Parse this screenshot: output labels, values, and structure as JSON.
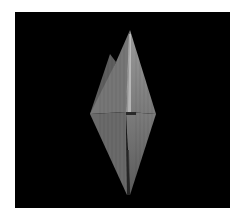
{
  "scene": {
    "subject": "crystal-polyhedron-render",
    "background_color": "#000000",
    "border_color": "#ffffff",
    "crystal_colors": {
      "front_face": "#8a8a8a",
      "left_face": "#6e6e6e",
      "right_face": "#7a7a7a",
      "back_spike": "#5e5e5e",
      "ridge_highlight": "#c8c8c8",
      "shadow_mark": "#2a2a2a"
    }
  }
}
